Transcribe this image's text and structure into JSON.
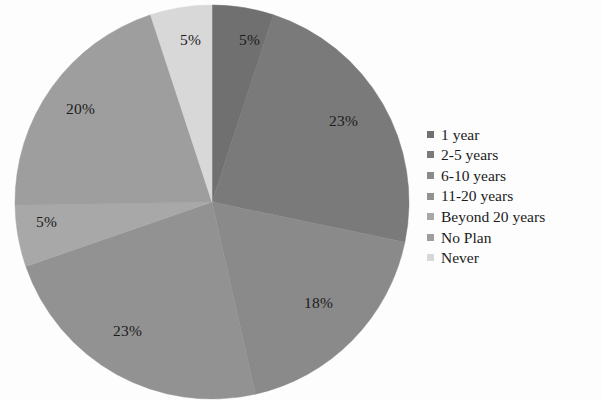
{
  "chart_data": {
    "type": "pie",
    "title": "",
    "categories": [
      "1 year",
      "2-5 years",
      "6-10 years",
      "11-20 years",
      "Beyond 20 years",
      "No Plan",
      "Never"
    ],
    "values": [
      5,
      23,
      18,
      23,
      5,
      20,
      5
    ],
    "value_labels": [
      "5%",
      "23%",
      "18%",
      "23%",
      "5%",
      "20%",
      "5%"
    ],
    "units": "percent",
    "legend_position": "right",
    "start_angle_deg": 0,
    "direction": "clockwise",
    "grid": false,
    "colors": [
      "#707070",
      "#7a7a7a",
      "#8a8a8a",
      "#929292",
      "#a8a8a8",
      "#9e9e9e",
      "#d8d8d8"
    ],
    "slices": [
      {
        "label": "1 year",
        "value": 5,
        "display": "5%",
        "color": "#707070",
        "label_x": 239,
        "label_y": 31
      },
      {
        "label": "2-5 years",
        "value": 23,
        "display": "23%",
        "color": "#7a7a7a",
        "label_x": 329,
        "label_y": 112
      },
      {
        "label": "6-10 years",
        "value": 18,
        "display": "18%",
        "color": "#8a8a8a",
        "label_x": 304,
        "label_y": 294
      },
      {
        "label": "11-20 years",
        "value": 23,
        "display": "23%",
        "color": "#929292",
        "label_x": 113,
        "label_y": 322
      },
      {
        "label": "Beyond 20 years",
        "value": 5,
        "display": "5%",
        "color": "#a8a8a8",
        "label_x": 36,
        "label_y": 213
      },
      {
        "label": "No Plan",
        "value": 20,
        "display": "20%",
        "color": "#9e9e9e",
        "label_x": 66,
        "label_y": 100
      },
      {
        "label": "Never",
        "value": 5,
        "display": "5%",
        "color": "#d8d8d8",
        "label_x": 180,
        "label_y": 31
      }
    ]
  },
  "legend": {
    "items": [
      {
        "label": "1 year",
        "color": "#707070"
      },
      {
        "label": "2-5 years",
        "color": "#7a7a7a"
      },
      {
        "label": "6-10 years",
        "color": "#8a8a8a"
      },
      {
        "label": "11-20 years",
        "color": "#929292"
      },
      {
        "label": "Beyond 20 years",
        "color": "#a8a8a8"
      },
      {
        "label": "No Plan",
        "color": "#9e9e9e"
      },
      {
        "label": "Never",
        "color": "#d8d8d8"
      }
    ]
  },
  "artifacts": {
    "bleed_top": "                       ",
    "bleed_legend_1": "               ",
    "bleed_legend_2": "               "
  }
}
